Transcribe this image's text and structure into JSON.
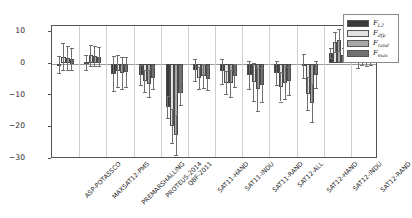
{
  "chart_data": {
    "type": "bar",
    "title": "",
    "xlabel": "",
    "ylabel": "Overlap in comparison to the\nnon-optimized setup (in %)",
    "ylim": [
      -30,
      12
    ],
    "yticks": [
      10,
      0,
      -10,
      -20,
      -30
    ],
    "ytick_labels": [
      "10",
      "0",
      "-10",
      "-20",
      "-30"
    ],
    "grid": "vertical-group-separators",
    "legend_position": "upper right",
    "categories": [
      "ASP-POTASSCO",
      "MAXSAT12-PMS",
      "PREMARSHALLING",
      "PROTEUS-2014",
      "QBF-2011",
      "SAT11-HAND",
      "SAT11-INDU",
      "SAT11-RAND",
      "SAT12-ALL",
      "SAT12-HAND",
      "SAT12-INDU",
      "SAT12-RAND"
    ],
    "series": [
      {
        "name": "F_L2",
        "label_base": "F",
        "label_sub": "L2",
        "color": "#3a3a3a",
        "values": [
          -0.3,
          0.4,
          -3.2,
          -3.6,
          -13.8,
          -2.0,
          -2.5,
          -3.6,
          -3.0,
          -0.8,
          3.2,
          1.0
        ],
        "err_low": [
          2.6,
          2.3,
          5.6,
          3.2,
          3.4,
          3.4,
          4.0,
          4.4,
          3.7,
          3.8,
          1.6,
          2.4
        ],
        "err_high": [
          2.6,
          2.3,
          5.6,
          3.2,
          3.4,
          3.4,
          4.0,
          4.4,
          3.7,
          3.8,
          1.6,
          2.4
        ]
      },
      {
        "name": "F_dfp",
        "label_base": "F",
        "label_sub": "dfp",
        "color": "#e2e2e2",
        "values": [
          2.2,
          2.6,
          -2.4,
          -5.5,
          -19.8,
          -4.6,
          -6.0,
          -5.8,
          -7.4,
          -9.6,
          6.8,
          1.9
        ],
        "err_low": [
          4.2,
          3.4,
          5.0,
          3.6,
          5.4,
          3.5,
          3.6,
          6.0,
          4.6,
          5.2,
          3.2,
          2.3
        ],
        "err_high": [
          4.2,
          3.4,
          5.0,
          3.6,
          5.4,
          3.5,
          3.6,
          6.0,
          4.6,
          5.2,
          3.2,
          2.3
        ]
      },
      {
        "name": "F_rand",
        "label_base": "F",
        "label_sub": "rand",
        "color": "#a8a8a8",
        "values": [
          1.7,
          2.3,
          -3.0,
          -6.4,
          -22.6,
          -4.0,
          -6.3,
          -8.2,
          -6.0,
          -12.6,
          7.4,
          1.4
        ],
        "err_low": [
          3.9,
          3.1,
          5.2,
          4.2,
          6.4,
          3.8,
          4.4,
          6.8,
          5.2,
          6.0,
          3.6,
          2.2
        ],
        "err_high": [
          3.9,
          3.1,
          5.2,
          4.2,
          6.4,
          3.8,
          4.4,
          6.8,
          5.2,
          6.0,
          3.6,
          2.2
        ]
      },
      {
        "name": "F_max",
        "label_base": "F",
        "label_sub": "max",
        "color": "#707070",
        "values": [
          1.5,
          2.1,
          -2.7,
          -4.6,
          -9.2,
          -4.8,
          -3.9,
          -6.8,
          -5.4,
          -3.5,
          2.6,
          1.6
        ],
        "err_low": [
          3.4,
          3.0,
          4.8,
          3.6,
          4.0,
          3.6,
          3.6,
          5.4,
          4.4,
          4.2,
          2.2,
          2.0
        ],
        "err_high": [
          3.4,
          3.0,
          4.8,
          3.6,
          4.0,
          3.6,
          3.6,
          5.4,
          4.4,
          4.2,
          2.2,
          2.0
        ]
      }
    ]
  },
  "legend": {
    "entries": [
      "F_L2",
      "F_dfp",
      "F_rand",
      "F_max"
    ]
  }
}
